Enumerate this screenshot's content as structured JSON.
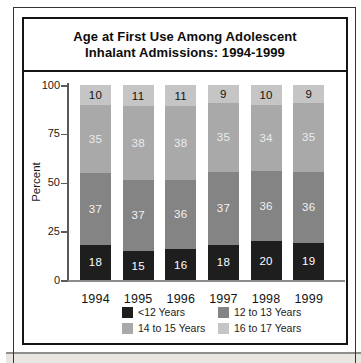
{
  "chart": {
    "title_line1": "Age at First Use Among Adolescent",
    "title_line2": "Inhalant Admissions: 1994-1999",
    "ylabel": "Percent"
  },
  "chart_data": {
    "type": "bar",
    "stacked": true,
    "title": "Age at First Use Among Adolescent Inhalant Admissions: 1994-1999",
    "xlabel": "",
    "ylabel": "Percent",
    "ylim": [
      0,
      100
    ],
    "yticks": [
      0,
      25,
      50,
      75,
      100
    ],
    "grid": false,
    "legend_position": "bottom",
    "categories": [
      "1994",
      "1995",
      "1996",
      "1997",
      "1998",
      "1999"
    ],
    "series": [
      {
        "name": "<12 Years",
        "color": "#1e1e1e",
        "label_color": "#ffffff",
        "hatch": false,
        "values": [
          18,
          15,
          16,
          18,
          20,
          19
        ]
      },
      {
        "name": "12 to 13 Years",
        "color": "#848484",
        "label_color": "#f2f2f2",
        "hatch": true,
        "values": [
          37,
          37,
          36,
          37,
          36,
          36
        ]
      },
      {
        "name": "14 to 15 Years",
        "color": "#a9a9a9",
        "label_color": "#ececec",
        "hatch": false,
        "values": [
          35,
          38,
          38,
          35,
          34,
          35
        ]
      },
      {
        "name": "16 to 17 Years",
        "color": "#c5c5c5",
        "label_color": "#121212",
        "hatch": false,
        "values": [
          10,
          11,
          11,
          9,
          10,
          9
        ]
      }
    ]
  }
}
